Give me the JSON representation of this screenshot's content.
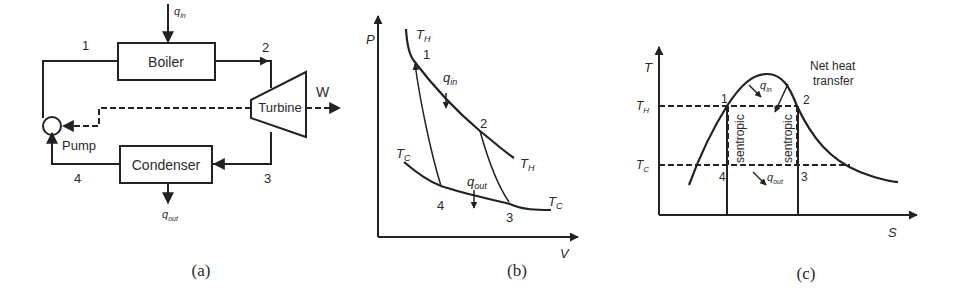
{
  "figure": {
    "panels": [
      {
        "id": "a",
        "caption": "(a)",
        "type": "rankine-cycle-schematic",
        "components": {
          "boiler": "Boiler",
          "turbine": "Turbine",
          "condenser": "Condenser",
          "pump": "Pump"
        },
        "state_points": [
          "1",
          "2",
          "3",
          "4"
        ],
        "heat_in": {
          "base": "q",
          "sub": "in"
        },
        "heat_out": {
          "base": "q",
          "sub": "out"
        },
        "work_label": "W"
      },
      {
        "id": "b",
        "caption": "(b)",
        "type": "pv-diagram",
        "x_axis": "V",
        "y_axis": "P",
        "state_points": [
          "1",
          "2",
          "3",
          "4"
        ],
        "isotherm_hot": {
          "base": "T",
          "sub": "H"
        },
        "isotherm_cold": {
          "base": "T",
          "sub": "C"
        },
        "heat_in": {
          "base": "q",
          "sub": "in"
        },
        "heat_out": {
          "base": "q",
          "sub": "out"
        }
      },
      {
        "id": "c",
        "caption": "(c)",
        "type": "ts-diagram",
        "x_axis": "S",
        "y_axis": "T",
        "state_points": [
          "1",
          "2",
          "3",
          "4"
        ],
        "level_hot": {
          "base": "T",
          "sub": "H"
        },
        "level_cold": {
          "base": "T",
          "sub": "C"
        },
        "heat_in": {
          "base": "q",
          "sub": "in"
        },
        "heat_out": {
          "base": "q",
          "sub": "out"
        },
        "isentropic_label": "sentropic",
        "annotation_line1": "Net heat",
        "annotation_line2": "transfer"
      }
    ]
  },
  "colors": {
    "stroke": "#222222",
    "text": "#2a2a2a",
    "background": "#ffffff"
  }
}
